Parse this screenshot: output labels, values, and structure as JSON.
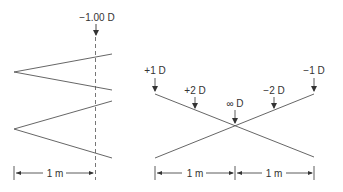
{
  "left_panel": {
    "top_label": "−1.00 D",
    "scale_label": "1 m"
  },
  "right_panel": {
    "labels": {
      "plus1": "+1 D",
      "plus2": "+2 D",
      "infinity": "∞ D",
      "minus2": "−2 D",
      "minus1": "−1 D"
    },
    "scale_left_label": "1 m",
    "scale_right_label": "1 m"
  },
  "colors": {
    "line": "#555555",
    "text": "#333333"
  }
}
